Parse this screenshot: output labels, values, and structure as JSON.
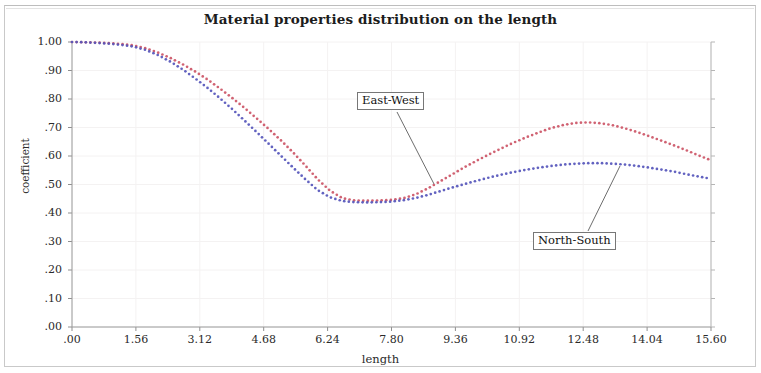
{
  "chart_data": {
    "type": "line",
    "title": "Material properties distribution on the length",
    "xlabel": "length",
    "ylabel": "coefficient",
    "xlim": [
      0,
      15.6
    ],
    "ylim": [
      0,
      1.0
    ],
    "grid": true,
    "legend_position": "inline-callout",
    "xticks": [
      ".00",
      "1.56",
      "3.12",
      "4.68",
      "6.24",
      "7.80",
      "9.36",
      "10.92",
      "12.48",
      "14.04",
      "15.60"
    ],
    "xtick_values": [
      0,
      1.56,
      3.12,
      4.68,
      6.24,
      7.8,
      9.36,
      10.92,
      12.48,
      14.04,
      15.6
    ],
    "yticks": [
      "1.00",
      ".90",
      ".80",
      ".70",
      ".60",
      ".50",
      ".40",
      ".30",
      ".20",
      ".10",
      ".00"
    ],
    "ytick_values": [
      1.0,
      0.9,
      0.8,
      0.7,
      0.6,
      0.5,
      0.4,
      0.3,
      0.2,
      0.1,
      0.0
    ],
    "series": [
      {
        "name": "East-West",
        "color": "#cc5566",
        "style": "dotted",
        "x": [
          0.0,
          0.3,
          0.6,
          0.9,
          1.2,
          1.5,
          1.8,
          2.1,
          2.4,
          2.7,
          3.0,
          3.3,
          3.6,
          3.9,
          4.2,
          4.5,
          4.8,
          5.1,
          5.4,
          5.7,
          6.0,
          6.3,
          6.6,
          6.9,
          7.2,
          7.5,
          7.8,
          8.1,
          8.4,
          8.7,
          9.0,
          9.3,
          9.6,
          9.9,
          10.2,
          10.5,
          10.8,
          11.1,
          11.4,
          11.7,
          12.0,
          12.3,
          12.6,
          12.9,
          13.2,
          13.5,
          13.8,
          14.1,
          14.4,
          14.7,
          15.0,
          15.3,
          15.6
        ],
        "y": [
          1.0,
          0.999,
          0.998,
          0.996,
          0.993,
          0.988,
          0.978,
          0.963,
          0.944,
          0.922,
          0.897,
          0.869,
          0.838,
          0.805,
          0.77,
          0.733,
          0.695,
          0.655,
          0.612,
          0.566,
          0.518,
          0.478,
          0.452,
          0.444,
          0.443,
          0.444,
          0.446,
          0.452,
          0.466,
          0.487,
          0.512,
          0.537,
          0.562,
          0.585,
          0.607,
          0.628,
          0.648,
          0.666,
          0.683,
          0.698,
          0.709,
          0.716,
          0.718,
          0.715,
          0.708,
          0.697,
          0.684,
          0.669,
          0.653,
          0.637,
          0.62,
          0.602,
          0.585
        ]
      },
      {
        "name": "North-South",
        "color": "#5555bb",
        "style": "dotted",
        "x": [
          0.0,
          0.3,
          0.6,
          0.9,
          1.2,
          1.5,
          1.8,
          2.1,
          2.4,
          2.7,
          3.0,
          3.3,
          3.6,
          3.9,
          4.2,
          4.5,
          4.8,
          5.1,
          5.4,
          5.7,
          6.0,
          6.3,
          6.6,
          6.9,
          7.2,
          7.5,
          7.8,
          8.1,
          8.4,
          8.7,
          9.0,
          9.3,
          9.6,
          9.9,
          10.2,
          10.5,
          10.8,
          11.1,
          11.4,
          11.7,
          12.0,
          12.3,
          12.6,
          12.9,
          13.2,
          13.5,
          13.8,
          14.1,
          14.4,
          14.7,
          15.0,
          15.3,
          15.6
        ],
        "y": [
          1.0,
          0.999,
          0.997,
          0.994,
          0.99,
          0.984,
          0.972,
          0.954,
          0.931,
          0.904,
          0.873,
          0.84,
          0.804,
          0.766,
          0.726,
          0.685,
          0.643,
          0.601,
          0.559,
          0.518,
          0.48,
          0.455,
          0.442,
          0.438,
          0.437,
          0.438,
          0.44,
          0.445,
          0.453,
          0.464,
          0.477,
          0.49,
          0.502,
          0.514,
          0.525,
          0.535,
          0.544,
          0.552,
          0.559,
          0.565,
          0.57,
          0.573,
          0.575,
          0.575,
          0.573,
          0.57,
          0.565,
          0.559,
          0.552,
          0.545,
          0.536,
          0.528,
          0.52
        ]
      }
    ],
    "annotations": [
      {
        "label": "East-West",
        "points_to_series": "East-West"
      },
      {
        "label": "North-South",
        "points_to_series": "North-South"
      }
    ]
  }
}
